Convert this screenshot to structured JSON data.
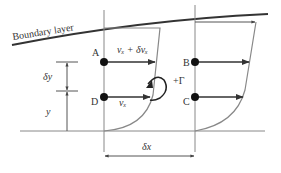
{
  "diagram": {
    "boundary_layer_label": "Boundary layer",
    "points": {
      "A": "A",
      "B": "B",
      "C": "C",
      "D": "D"
    },
    "velocity_upper": "vₓ + δvₓ",
    "velocity_lower": "vₓ",
    "circulation_label": "+Γ",
    "dy_label": "δy",
    "y_label": "y",
    "dx_label": "δx",
    "colors": {
      "line": "#333333",
      "profile": "#777777",
      "thin": "#888888"
    }
  }
}
